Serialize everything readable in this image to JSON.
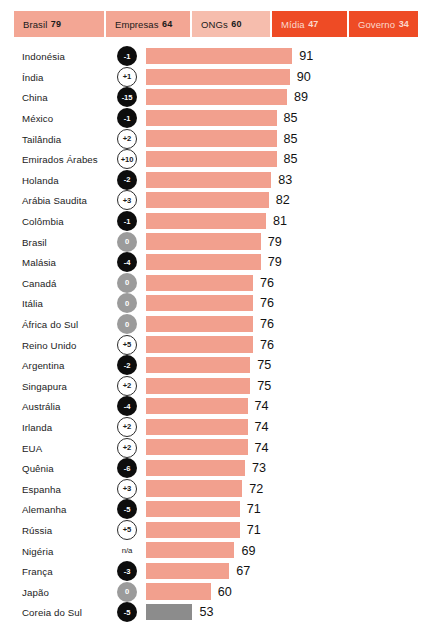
{
  "header": {
    "tabs": [
      {
        "label": "Brasil",
        "value": "79",
        "style": "salmon",
        "width": "w-brasil"
      },
      {
        "label": "Empresas",
        "value": "64",
        "style": "salmon",
        "width": "w-empresas"
      },
      {
        "label": "ONGs",
        "value": "60",
        "style": "pale",
        "width": "w-ongs"
      },
      {
        "label": "Mídia",
        "value": "47",
        "style": "orange",
        "width": "w-midia"
      },
      {
        "label": "Governo",
        "value": "34",
        "style": "orange",
        "width": "w-governo"
      }
    ]
  },
  "colors": {
    "bar_primary": "#f2a08e",
    "bar_highlight": "#8c8c8c",
    "tab_salmon": "#f3a694",
    "tab_pale": "#f6bdad",
    "tab_orange": "#ee4b25",
    "badge_negative": "#0d0d0d",
    "badge_zero": "#9b9b9b"
  },
  "chart_data": {
    "type": "bar",
    "title": "",
    "xlabel": "",
    "ylabel": "",
    "orientation": "horizontal",
    "xlim": [
      0,
      100
    ],
    "grid": false,
    "legend": null,
    "value_axis_scale_px_per_unit": 2.63,
    "categories": [
      "Indonésia",
      "Índia",
      "China",
      "México",
      "Tailândia",
      "Emirados Árabes",
      "Holanda",
      "Arábia Saudita",
      "Colômbia",
      "Brasil",
      "Malásia",
      "Canadá",
      "Itália",
      "África do Sul",
      "Reino Unido",
      "Argentina",
      "Singapura",
      "Austrália",
      "Irlanda",
      "EUA",
      "Quênia",
      "Espanha",
      "Alemanha",
      "Rússia",
      "Nigéria",
      "França",
      "Japão",
      "Coreia do Sul"
    ],
    "values": [
      91,
      90,
      89,
      85,
      85,
      85,
      83,
      82,
      81,
      79,
      79,
      76,
      76,
      76,
      76,
      75,
      75,
      74,
      74,
      74,
      73,
      72,
      71,
      71,
      69,
      67,
      60,
      53
    ],
    "deltas": [
      "-1",
      "+1",
      "-15",
      "-1",
      "+2",
      "+10",
      "-2",
      "+3",
      "-1",
      "0",
      "-4",
      "0",
      "0",
      "0",
      "+5",
      "-2",
      "+2",
      "-4",
      "+2",
      "+2",
      "-6",
      "+3",
      "-5",
      "+5",
      "n/a",
      "-3",
      "0",
      "-5"
    ],
    "delta_kinds": [
      "neg",
      "pos",
      "neg",
      "neg",
      "pos",
      "pos",
      "neg",
      "pos",
      "neg",
      "zero",
      "neg",
      "zero",
      "zero",
      "zero",
      "pos",
      "neg",
      "pos",
      "neg",
      "pos",
      "pos",
      "neg",
      "pos",
      "neg",
      "pos",
      "na",
      "neg",
      "zero",
      "neg"
    ],
    "bar_styles": [
      "",
      "",
      "",
      "",
      "",
      "",
      "",
      "",
      "",
      "",
      "",
      "",
      "",
      "",
      "",
      "",
      "",
      "",
      "",
      "",
      "",
      "",
      "",
      "",
      "",
      "",
      "",
      "grey"
    ]
  }
}
